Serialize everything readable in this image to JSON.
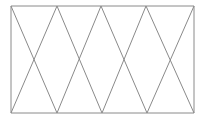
{
  "figure": {
    "type": "line-drawing",
    "canvas": {
      "width": 206,
      "height": 120,
      "background": "#ffffff"
    },
    "style": {
      "stroke_color": "#8a8a8a",
      "stroke_width": 1,
      "fill": "none"
    },
    "geometry": {
      "top_y": 6,
      "bottom_y": 113,
      "left_x": 11,
      "right_x": 194,
      "top_vertices_x": [
        11,
        57,
        101,
        146,
        194
      ],
      "bottom_vertices_x": [
        11,
        57,
        102,
        147,
        194
      ],
      "crossing_points": [
        {
          "x": 34,
          "y": 60
        },
        {
          "x": 79,
          "y": 60
        },
        {
          "x": 124,
          "y": 60
        },
        {
          "x": 170,
          "y": 60
        }
      ],
      "cell_count": 4,
      "triangle_count": 9
    },
    "edges": {
      "top_edge": {
        "x1": 11,
        "y1": 6,
        "x2": 194,
        "y2": 6
      },
      "bottom_edge": {
        "x1": 11,
        "y1": 113,
        "x2": 194,
        "y2": 113
      },
      "left_end": {
        "x1": 11,
        "y1": 6,
        "x2": 11,
        "y2": 113
      },
      "right_end": {
        "x1": 194,
        "y1": 6,
        "x2": 194,
        "y2": 113
      }
    },
    "diagonals": [
      {
        "name": "cell-1-down-right",
        "x1": 11,
        "y1": 6,
        "x2": 57,
        "y2": 113
      },
      {
        "name": "cell-1-down-left",
        "x1": 57,
        "y1": 6,
        "x2": 11,
        "y2": 113
      },
      {
        "name": "cell-2-down-right",
        "x1": 57,
        "y1": 6,
        "x2": 102,
        "y2": 113
      },
      {
        "name": "cell-2-down-left",
        "x1": 101,
        "y1": 6,
        "x2": 57,
        "y2": 113
      },
      {
        "name": "cell-3-down-right",
        "x1": 101,
        "y1": 6,
        "x2": 147,
        "y2": 113
      },
      {
        "name": "cell-3-down-left",
        "x1": 146,
        "y1": 6,
        "x2": 102,
        "y2": 113
      },
      {
        "name": "cell-4-down-right",
        "x1": 146,
        "y1": 6,
        "x2": 194,
        "y2": 113
      },
      {
        "name": "cell-4-down-left",
        "x1": 194,
        "y1": 6,
        "x2": 147,
        "y2": 113
      }
    ]
  }
}
